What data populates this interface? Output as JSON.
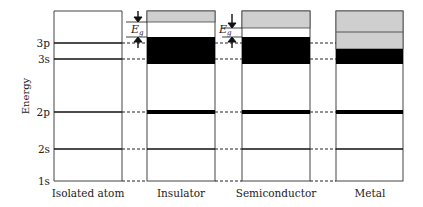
{
  "diagram": {
    "y_axis_label": "Energy",
    "levels": [
      {
        "name": "3p",
        "label": "3p",
        "y": 43
      },
      {
        "name": "3s",
        "label": "3s",
        "y": 59
      },
      {
        "name": "2p",
        "label": "2p",
        "y": 112
      },
      {
        "name": "2s",
        "label": "2s",
        "y": 149
      },
      {
        "name": "1s",
        "label": "1s",
        "y": 181
      }
    ],
    "columns": [
      {
        "name": "isolated-atom",
        "label": "Isolated atom"
      },
      {
        "name": "insulator",
        "label": "Insulator"
      },
      {
        "name": "semiconductor",
        "label": "Semiconductor"
      },
      {
        "name": "metal",
        "label": "Metal"
      }
    ],
    "gap_label_main": "E",
    "gap_label_sub": "g",
    "colors": {
      "filled_band": "#000000",
      "empty_band": "#cfcfcf",
      "line": "#222222",
      "frame": "#444444"
    }
  }
}
